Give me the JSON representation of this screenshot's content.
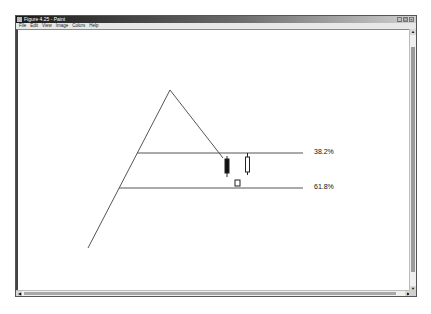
{
  "window": {
    "title": "Figure 4.25 - Paint",
    "controls": [
      "minimize",
      "maximize",
      "close"
    ]
  },
  "menu": {
    "items": [
      {
        "label": "File"
      },
      {
        "label": "Edit"
      },
      {
        "label": "View"
      },
      {
        "label": "Image"
      },
      {
        "label": "Colors"
      },
      {
        "label": "Help"
      }
    ]
  },
  "drawing": {
    "swing_lines": [
      {
        "name": "left-leg",
        "x1": 88,
        "y1": 248,
        "x2": 170,
        "y2": 90
      },
      {
        "name": "right-leg",
        "x1": 170,
        "y1": 90,
        "x2": 223,
        "y2": 158
      }
    ],
    "retracement_levels": [
      {
        "label": "38.2%",
        "y": 153,
        "x1": 137,
        "x2": 303,
        "label_x": 314,
        "label_y": 148
      },
      {
        "label": "61.8%",
        "y": 188,
        "x1": 119,
        "x2": 303,
        "label_x": 314,
        "label_y": 183
      }
    ],
    "candles": [
      {
        "type": "bearish",
        "x": 227,
        "wick_top": 156,
        "wick_bottom": 177,
        "body_top": 159,
        "body_bottom": 173,
        "fill": "#111111"
      },
      {
        "type": "bullish",
        "x": 247.5,
        "wick_top": 153,
        "wick_bottom": 175,
        "body_top": 157,
        "body_bottom": 172,
        "fill": "#ffffff"
      },
      {
        "type": "bullish-small",
        "x": 237.5,
        "wick_top": 180,
        "wick_bottom": 186,
        "body_top": 180,
        "body_bottom": 186,
        "fill": "#ffffff"
      }
    ],
    "line_color": "#555555"
  }
}
